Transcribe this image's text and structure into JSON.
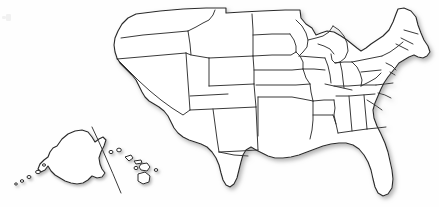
{
  "figure": {
    "width": 439,
    "height": 207
  },
  "style": {
    "background_color": "#fefefe",
    "land_fill_color": "#ffffff",
    "outline_color": "#2a2a2a",
    "state_border_color": "#2f2f2f",
    "shadow_color": "#b8b8b8",
    "divider_color": "#3a3a3a"
  },
  "regions": [
    {
      "id": "contiguous-united-states",
      "name": "Contiguous United States",
      "label": "Lower 48",
      "fill": "#ffffff",
      "outline": "#2a2a2a"
    },
    {
      "id": "alaska-inset",
      "name": "Alaska",
      "label": "Alaska",
      "fill": "#ffffff",
      "outline": "#2a2a2a"
    },
    {
      "id": "hawaii-inset",
      "name": "Hawaii",
      "label": "Hawaii",
      "fill": "#ffffff",
      "outline": "#2a2a2a"
    }
  ],
  "inset_divider": {
    "name": "inset-divider-line",
    "description": "Diagonal line separating the Alaska inset from the Hawaii inset",
    "color": "#3a3a3a"
  },
  "hawaii_islands": [
    {
      "name": "Niihau"
    },
    {
      "name": "Kauai"
    },
    {
      "name": "Oahu"
    },
    {
      "name": "Molokai"
    },
    {
      "name": "Lanai"
    },
    {
      "name": "Maui"
    },
    {
      "name": "Hawaii (Big Island)"
    }
  ],
  "aleutian_islands": [
    {
      "name": "Aleutian island dot 1"
    },
    {
      "name": "Aleutian island dot 2"
    },
    {
      "name": "Aleutian island dot 3"
    },
    {
      "name": "Aleutian island dot 4"
    },
    {
      "name": "Aleutian island dot 5"
    }
  ],
  "labels": {
    "none_visible": ""
  }
}
